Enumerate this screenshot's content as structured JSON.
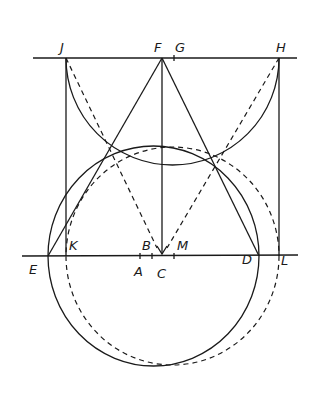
{
  "figure": {
    "type": "geometric-construction",
    "stroke_color": "#1a1a1a",
    "background": "#ffffff"
  },
  "points": {
    "J": {
      "label": "J",
      "x": 66,
      "y": 58
    },
    "F": {
      "label": "F",
      "x": 162,
      "y": 58
    },
    "G": {
      "label": "G",
      "x": 174,
      "y": 58
    },
    "H": {
      "label": "H",
      "x": 279,
      "y": 58
    },
    "E": {
      "label": "E",
      "x": 48,
      "y": 256
    },
    "K": {
      "label": "K",
      "x": 66,
      "y": 256
    },
    "A": {
      "label": "A",
      "x": 140,
      "y": 256
    },
    "B": {
      "label": "B",
      "x": 152,
      "y": 256
    },
    "C": {
      "label": "C",
      "x": 162,
      "y": 256
    },
    "M": {
      "label": "M",
      "x": 174,
      "y": 256
    },
    "D": {
      "label": "D",
      "x": 259,
      "y": 256
    },
    "L": {
      "label": "L",
      "x": 279,
      "y": 256
    }
  },
  "lines": {
    "top_horizontal": "line through J, F, G, H",
    "bottom_horizontal": "line through E, K, A, B, C, M, D, L",
    "solid_segments": [
      "J-K",
      "H-L",
      "F-C",
      "F-E",
      "F-D"
    ],
    "dashed_segments": [
      "J-C",
      "H-C"
    ]
  },
  "circles": {
    "solid_circle": "through E and D",
    "dashed_circle": "through K and L",
    "upper_arc": "arc from J to H"
  }
}
